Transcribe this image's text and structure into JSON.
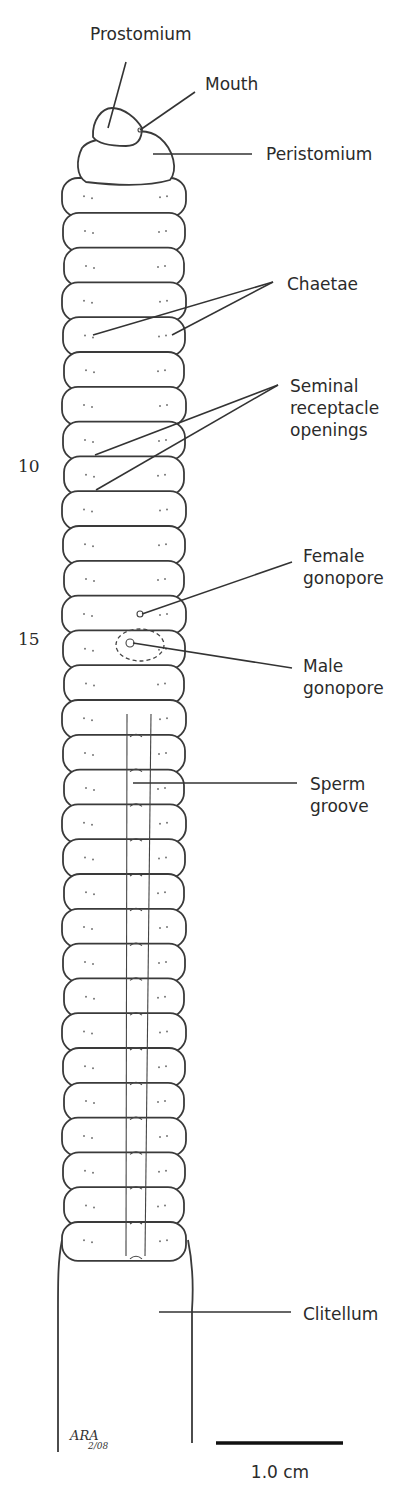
{
  "diagram": {
    "colors": {
      "ink": "#3a3a3a",
      "background": "#ffffff"
    },
    "segment_numbers": [
      {
        "text": "10",
        "x": 18,
        "y": 472
      },
      {
        "text": "15",
        "x": 18,
        "y": 645
      }
    ],
    "labels": [
      {
        "id": "prostomium",
        "lines": [
          "Prostomium"
        ],
        "x": 90,
        "y": 40
      },
      {
        "id": "mouth",
        "lines": [
          "Mouth"
        ],
        "x": 205,
        "y": 90
      },
      {
        "id": "peristomium",
        "lines": [
          "Peristomium"
        ],
        "x": 266,
        "y": 160
      },
      {
        "id": "chaetae",
        "lines": [
          "Chaetae"
        ],
        "x": 287,
        "y": 290
      },
      {
        "id": "seminal-receptacle-openings",
        "lines": [
          "Seminal",
          "receptacle",
          "openings"
        ],
        "x": 290,
        "y": 392
      },
      {
        "id": "female-gonopore",
        "lines": [
          "Female",
          "gonopore"
        ],
        "x": 303,
        "y": 562
      },
      {
        "id": "male-gonopore",
        "lines": [
          "Male",
          "gonopore"
        ],
        "x": 303,
        "y": 672
      },
      {
        "id": "sperm-groove",
        "lines": [
          "Sperm",
          "groove"
        ],
        "x": 310,
        "y": 790
      },
      {
        "id": "clitellum",
        "lines": [
          "Clitellum"
        ],
        "x": 303,
        "y": 1320
      }
    ],
    "leaders": [
      {
        "id": "prostomium-leader",
        "points": [
          [
            126,
            62
          ],
          [
            108,
            128
          ]
        ]
      },
      {
        "id": "mouth-leader",
        "points": [
          [
            195,
            92
          ],
          [
            140,
            130
          ]
        ]
      },
      {
        "id": "peristomium-leader",
        "points": [
          [
            153,
            154
          ],
          [
            252,
            154
          ]
        ]
      },
      {
        "id": "chaetae-leader-1",
        "points": [
          [
            273,
            282
          ],
          [
            93,
            335
          ]
        ]
      },
      {
        "id": "chaetae-leader-2",
        "points": [
          [
            273,
            282
          ],
          [
            172,
            335
          ]
        ]
      },
      {
        "id": "seminal-leader-1",
        "points": [
          [
            278,
            385
          ],
          [
            95,
            455
          ]
        ]
      },
      {
        "id": "seminal-leader-2",
        "points": [
          [
            278,
            385
          ],
          [
            96,
            490
          ]
        ]
      },
      {
        "id": "female-gonopore-leader",
        "points": [
          [
            292,
            562
          ],
          [
            142,
            614
          ]
        ]
      },
      {
        "id": "male-gonopore-leader",
        "points": [
          [
            292,
            668
          ],
          [
            133,
            643
          ]
        ]
      },
      {
        "id": "sperm-groove-leader",
        "points": [
          [
            133,
            783
          ],
          [
            297,
            783
          ]
        ]
      },
      {
        "id": "clitellum-leader",
        "points": [
          [
            159,
            1312
          ],
          [
            291,
            1312
          ]
        ]
      }
    ],
    "body": {
      "first_segment_top": 180,
      "segment_height": 34.8,
      "segment_count": 31,
      "left_x": 63,
      "right_x": 185,
      "groove_start_segment": 16,
      "groove_left_x": 127,
      "groove_right_x": 145,
      "clitellum": {
        "top": 1240,
        "bottom": 1452,
        "left_x": 58,
        "right_x": 192
      }
    },
    "scale_bar": {
      "label": "1.0 cm",
      "x1": 216,
      "x2": 343,
      "y": 1443,
      "label_x": 280,
      "label_y": 1478
    },
    "signature": {
      "initials": "ARA",
      "date": "2/08",
      "x": 70,
      "y": 1440
    }
  }
}
